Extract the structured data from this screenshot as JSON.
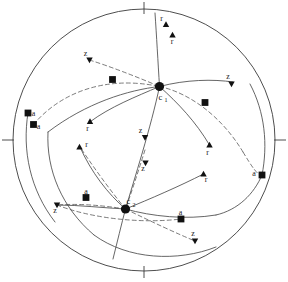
{
  "figure": {
    "type": "stereographic-pole-figure",
    "primitive_circle": {
      "cx": 144,
      "cy": 140,
      "r": 131,
      "stroke": "#3a3a3a",
      "stroke_width": 0.9
    },
    "tick_marks": [
      {
        "name": "tick-top",
        "x1": 144,
        "y1": 2,
        "x2": 144,
        "y2": 14
      },
      {
        "name": "tick-bottom",
        "x1": 144,
        "y1": 266,
        "x2": 144,
        "y2": 278
      },
      {
        "name": "tick-left",
        "x1": 2,
        "y1": 140,
        "x2": 14,
        "y2": 140
      },
      {
        "name": "tick-right",
        "x1": 274,
        "y1": 140,
        "x2": 286,
        "y2": 140
      }
    ],
    "colors": {
      "ink": "#1a1a1a",
      "circle": "#3a3a3a",
      "solid_arc": "#4a4a4a",
      "dashed_arc": "#5a5a5a",
      "marker_fill": "#111111",
      "background": "#ffffff"
    },
    "centers": [
      {
        "id": "c1",
        "label": "c",
        "subscript": "1",
        "cx": 159.5,
        "cy": 86.5,
        "r": 4.6,
        "label_x": 160.5,
        "label_y": 99.5,
        "sub_x": 166.0,
        "sub_y": 102.0
      },
      {
        "id": "c2",
        "label": "c",
        "subscript": "2",
        "cx": 125.5,
        "cy": 209.0,
        "r": 4.6,
        "label_x": 128.5,
        "label_y": 203.5,
        "sub_x": 134.0,
        "sub_y": 206.5
      }
    ],
    "poles": [
      {
        "id": "r-top",
        "label": "r",
        "marker": "triangle-up",
        "x": 166.0,
        "y": 24.5,
        "label_x": 161.5,
        "label_y": 21.0
      },
      {
        "id": "f-top",
        "label": "r",
        "marker": "triangle-up",
        "x": 172.5,
        "y": 35.0,
        "label_x": 172.0,
        "label_y": 44.0
      },
      {
        "id": "z-upper-left",
        "label": "z",
        "marker": "triangle-down",
        "x": 89.5,
        "y": 60.0,
        "label_x": 85.5,
        "label_y": 55.5
      },
      {
        "id": "z-upper-right",
        "label": "z",
        "marker": "triangle-down",
        "x": 231.5,
        "y": 84.0,
        "label_x": 228.0,
        "label_y": 79.0
      },
      {
        "id": "sq-upper-mid",
        "label": "",
        "marker": "square",
        "x": 112.5,
        "y": 79.5,
        "label_x": 0,
        "label_y": 0
      },
      {
        "id": "sq-upper-rt",
        "label": "",
        "marker": "square",
        "x": 205.0,
        "y": 102.5,
        "label_x": 0,
        "label_y": 0
      },
      {
        "id": "a-left-upper",
        "label": "a",
        "marker": "square",
        "x": 28.0,
        "y": 113.0,
        "label_x": 33.5,
        "label_y": 115.5
      },
      {
        "id": "a-left-lower",
        "label": "a",
        "marker": "square",
        "x": 33.5,
        "y": 124.5,
        "label_x": 38.5,
        "label_y": 128.5
      },
      {
        "id": "r-mid-left",
        "label": "r",
        "marker": "triangle-up",
        "x": 90.0,
        "y": 121.5,
        "label_x": 87.5,
        "label_y": 131.0
      },
      {
        "id": "r-mid-left2",
        "label": "r",
        "marker": "triangle-up",
        "x": 79.5,
        "y": 147.0,
        "label_x": 86.5,
        "label_y": 146.5
      },
      {
        "id": "z-center-up",
        "label": "z",
        "marker": "triangle-down",
        "x": 145.0,
        "y": 137.5,
        "label_x": 140.5,
        "label_y": 133.0
      },
      {
        "id": "z-center-low",
        "label": "z",
        "marker": "triangle-down",
        "x": 145.5,
        "y": 163.0,
        "label_x": 143.0,
        "label_y": 170.5
      },
      {
        "id": "r-right-up",
        "label": "r",
        "marker": "triangle-up",
        "x": 209.5,
        "y": 145.0,
        "label_x": 207.5,
        "label_y": 154.5
      },
      {
        "id": "r-right-low",
        "label": "r",
        "marker": "triangle-up",
        "x": 203.5,
        "y": 174.0,
        "label_x": 206.0,
        "label_y": 181.5
      },
      {
        "id": "a-right",
        "label": "a",
        "marker": "square",
        "x": 262.0,
        "y": 175.0,
        "label_x": 254.0,
        "label_y": 175.5
      },
      {
        "id": "a-bot-left",
        "label": "a",
        "marker": "square",
        "x": 86.0,
        "y": 197.5,
        "label_x": 86.0,
        "label_y": 193.5
      },
      {
        "id": "z-bot-left",
        "label": "z",
        "marker": "triangle-down",
        "x": 57.0,
        "y": 205.0,
        "label_x": 55.0,
        "label_y": 213.0
      },
      {
        "id": "a-bot-right",
        "label": "a",
        "marker": "square",
        "x": 181.0,
        "y": 219.0,
        "label_x": 180.5,
        "label_y": 215.0
      },
      {
        "id": "z-bot-right",
        "label": "z",
        "marker": "triangle-down",
        "x": 195.0,
        "y": 241.0,
        "label_x": 193.0,
        "label_y": 236.0
      }
    ],
    "solid_arcs": [
      {
        "name": "arc-c1-vertical-upper",
        "d": "M 155.0 13.0 C 156.5 35.0 158.0 62.0 159.5 86.5"
      },
      {
        "name": "arc-c1-east-z",
        "d": "M 159.5 86.5 C 186.0 79.5 213.0 79.0 233.0 82.0"
      },
      {
        "name": "arc-c1-west",
        "d": "M 159.5 86.5 C 128.0 90.0 86.0 103.0 48.0 132.0"
      },
      {
        "name": "arc-c1-down-right-r",
        "d": "M 159.5 86.5 C 178.0 103.0 196.0 122.0 209.5 145.0"
      },
      {
        "name": "arc-c1-down-left-r",
        "d": "M 159.5 86.5 C 135.0 97.0 110.0 107.0 90.5 121.5"
      },
      {
        "name": "arc-c1-c2-axis",
        "d": "M 159.5 86.5 C 151.0 127.0 134.0 180.0 125.5 209.0"
      },
      {
        "name": "arc-c2-down-axis",
        "d": "M 125.5 209.0 C 121.5 224.0 117.0 243.0 113.0 259.0"
      },
      {
        "name": "arc-c2-east-a",
        "d": "M 125.5 209.0 C 152.0 216.5 186.0 220.0 216.0 215.0"
      },
      {
        "name": "arc-c2-east-up",
        "d": "M 216.0 215.0 C 238.0 210.0 254.0 194.0 262.0 175.0"
      },
      {
        "name": "arc-c2-west-z",
        "d": "M 125.5 209.0 C 104.0 208.0 80.0 205.0 57.0 205.0"
      },
      {
        "name": "arc-c2-up-right-r",
        "d": "M 125.5 209.0 C 150.0 199.0 180.0 186.0 203.5 174.0"
      },
      {
        "name": "arc-c2-up-left",
        "d": "M 125.5 209.0 C 108.0 194.0 91.0 172.0 80.0 147.0"
      },
      {
        "name": "arc-big-lower-left",
        "d": "M 48.0 132.0 C 46.0 170.0 62.0 208.0 94.0 235.0"
      },
      {
        "name": "arc-big-lower-right",
        "d": "M 94.0 235.0 C 128.0 260.0 178.0 262.0 216.0 247.0"
      },
      {
        "name": "arc-left-a-down",
        "d": "M 28.0 113.0 C 22.0 150.0 30.0 190.0 55.0 222.0"
      },
      {
        "name": "arc-right-a-up",
        "d": "M 262.0 175.0 C 268.0 145.0 265.0 112.0 250.0 84.0"
      }
    ],
    "dashed_arcs": [
      {
        "name": "dash-upper-ellipse",
        "d": "M 33.5 124.5 C 60.0 93.0 105.0 75.0 159.5 86.5"
      },
      {
        "name": "dash-upper-right",
        "d": "M 159.5 86.5 C 190.0 93.0 222.0 117.0 243.0 152.0"
      },
      {
        "name": "dash-mid-right-down",
        "d": "M 243.0 152.0 C 252.0 167.0 258.0 176.0 262.0 175.0"
      },
      {
        "name": "dash-z-upperleft",
        "d": "M 89.5 60.0 C 110.0 66.5 135.0 76.0 159.5 86.5"
      },
      {
        "name": "dash-c2-left",
        "d": "M 125.5 209.0 C 100.0 205.0 78.0 203.5 57.0 205.0"
      },
      {
        "name": "dash-c2-up-left-r",
        "d": "M 125.5 209.0 C 110.0 190.0 94.0 168.0 80.0 147.0"
      },
      {
        "name": "dash-c2-right-lower",
        "d": "M 125.5 209.0 C 152.0 222.0 178.0 234.0 195.0 241.0"
      },
      {
        "name": "dash-c1c2-axis-low",
        "d": "M 145.0 150.0 C 138.0 172.0 131.0 194.0 125.5 209.0"
      },
      {
        "name": "dash-lower-arc",
        "d": "M 57.0 205.0 C 90.0 218.0 140.0 224.0 181.0 219.0"
      }
    ],
    "marker_sizes": {
      "square": 3.4,
      "triangle": 3.2,
      "center_dot": 4.6
    }
  }
}
